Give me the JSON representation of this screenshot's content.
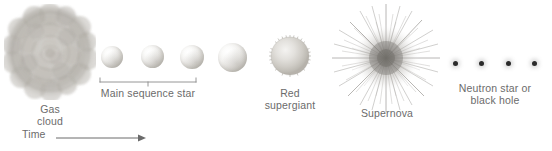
{
  "figure": {
    "kind": "stellar-evolution-diagram",
    "background_color": "#ffffff",
    "ink_color": "#6b6b6b",
    "width": 552,
    "height": 151
  },
  "labels": {
    "gas_cloud": "Gas\ncloud",
    "main_sequence": "Main sequence star",
    "red_supergiant": "Red\nsupergiant",
    "supernova": "Supernova",
    "remnant": "Neutron star or\nblack hole",
    "time": "Time"
  },
  "stages": [
    {
      "id": "gas-cloud",
      "label": "Gas\ncloud",
      "shape": "billowing-cloud",
      "center_x": 50,
      "center_y": 52,
      "size": 92,
      "color": "#9d9a95"
    },
    {
      "id": "main-sequence-star-1",
      "label": "",
      "shape": "sphere",
      "center_x": 112,
      "center_y": 57,
      "size": 22,
      "color": "#e2e0dc"
    },
    {
      "id": "main-sequence-star-2",
      "label": "",
      "shape": "sphere",
      "center_x": 153,
      "center_y": 57,
      "size": 23,
      "color": "#e2e0dc"
    },
    {
      "id": "main-sequence-star-3",
      "label": "",
      "shape": "sphere",
      "center_x": 192,
      "center_y": 57,
      "size": 24,
      "color": "#e2e0dc"
    },
    {
      "id": "main-sequence-star-4",
      "label": "",
      "shape": "sphere",
      "center_x": 233,
      "center_y": 58,
      "size": 29,
      "color": "#e2e0dc"
    },
    {
      "id": "red-supergiant",
      "label": "Red\nsupergiant",
      "shape": "fuzzy-sphere",
      "center_x": 290,
      "center_y": 56,
      "size": 44,
      "color": "#d2cfc9"
    },
    {
      "id": "supernova",
      "label": "Supernova",
      "shape": "radial-burst",
      "center_x": 386,
      "center_y": 58,
      "size": 112,
      "color": "#8d8a85"
    },
    {
      "id": "remnant-dot-1",
      "label": "",
      "shape": "dot",
      "center_x": 456,
      "center_y": 64,
      "size": 5,
      "color": "#2b2b2b"
    },
    {
      "id": "remnant-dot-2",
      "label": "",
      "shape": "dot",
      "center_x": 482,
      "center_y": 64,
      "size": 5,
      "color": "#2b2b2b"
    },
    {
      "id": "remnant-dot-3",
      "label": "",
      "shape": "dot",
      "center_x": 509,
      "center_y": 64,
      "size": 5,
      "color": "#2b2b2b"
    },
    {
      "id": "remnant-dot-4",
      "label": "",
      "shape": "dot",
      "center_x": 535,
      "center_y": 64,
      "size": 5,
      "color": "#2b2b2b"
    }
  ],
  "bracket": {
    "name": "main-sequence-bracket",
    "left_x": 99,
    "right_x": 197,
    "y": 80,
    "tick_x": 148,
    "color": "#8b8b8b"
  },
  "time_axis": {
    "label": "Time",
    "arrow_start_x": 56,
    "arrow_end_x": 146,
    "y": 134,
    "direction": "right",
    "color": "#6b6b6b"
  }
}
